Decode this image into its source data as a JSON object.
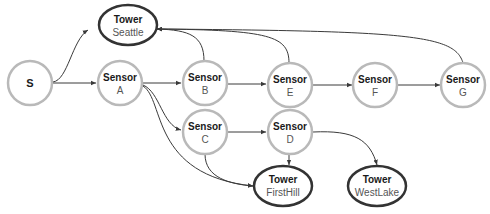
{
  "diagram": {
    "type": "directed-graph",
    "colors": {
      "sensor_border": "#b9b9b9",
      "tower_border": "#333333",
      "edge": "#3a3a3a"
    },
    "nodes": {
      "S": {
        "title": "S"
      },
      "Seattle": {
        "title": "Tower",
        "sub": "Seattle"
      },
      "A": {
        "title": "Sensor",
        "sub": "A"
      },
      "B": {
        "title": "Sensor",
        "sub": "B"
      },
      "E": {
        "title": "Sensor",
        "sub": "E"
      },
      "F": {
        "title": "Sensor",
        "sub": "F"
      },
      "G": {
        "title": "Sensor",
        "sub": "G"
      },
      "C": {
        "title": "Sensor",
        "sub": "C"
      },
      "D": {
        "title": "Sensor",
        "sub": "D"
      },
      "FirstHill": {
        "title": "Tower",
        "sub": "FirstHill"
      },
      "WestLake": {
        "title": "Tower",
        "sub": "WestLake"
      }
    },
    "edges": [
      [
        "S",
        "Seattle"
      ],
      [
        "S",
        "A"
      ],
      [
        "A",
        "B"
      ],
      [
        "A",
        "C"
      ],
      [
        "A",
        "FirstHill"
      ],
      [
        "B",
        "E"
      ],
      [
        "B",
        "Seattle"
      ],
      [
        "E",
        "F"
      ],
      [
        "E",
        "Seattle"
      ],
      [
        "F",
        "G"
      ],
      [
        "G",
        "Seattle"
      ],
      [
        "C",
        "D"
      ],
      [
        "C",
        "FirstHill"
      ],
      [
        "D",
        "FirstHill"
      ],
      [
        "D",
        "WestLake"
      ]
    ]
  }
}
